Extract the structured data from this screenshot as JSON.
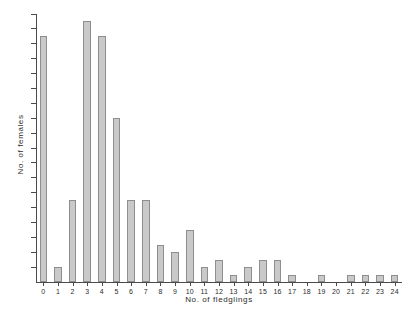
{
  "chart_data": {
    "type": "bar",
    "title": "",
    "xlabel": "No. of fledglings",
    "ylabel": "No. of females",
    "categories": [
      "0",
      "1",
      "2",
      "3",
      "4",
      "5",
      "6",
      "7",
      "8",
      "9",
      "10",
      "11",
      "12",
      "13",
      "14",
      "15",
      "16",
      "17",
      "18",
      "19",
      "20",
      "21",
      "22",
      "23",
      "24"
    ],
    "values": [
      33,
      2,
      11,
      35,
      33,
      22,
      11,
      11,
      5,
      4,
      7,
      2,
      3,
      1,
      2,
      3,
      3,
      1,
      0,
      1,
      0,
      1,
      1,
      1,
      1
    ],
    "series": [
      {
        "name": "No. of females",
        "values": [
          33,
          2,
          11,
          35,
          33,
          22,
          11,
          11,
          5,
          4,
          7,
          2,
          3,
          1,
          2,
          3,
          3,
          1,
          0,
          1,
          0,
          1,
          1,
          1,
          1
        ]
      }
    ],
    "xlim": [
      -0.5,
      24.5
    ],
    "ylim": [
      0,
      36
    ],
    "y_ticks": [
      2,
      4,
      6,
      8,
      10,
      12,
      14,
      16,
      18,
      20,
      22,
      24,
      26,
      28,
      30,
      32,
      34,
      36
    ],
    "y_tick_labels": [
      "2",
      "4",
      "6",
      "8",
      "10",
      "12",
      "14",
      "16",
      "18",
      "20",
      "22",
      "24",
      "26",
      "28",
      "30",
      "32",
      "34",
      "36"
    ],
    "x_ticks": [
      0,
      1,
      2,
      3,
      4,
      5,
      6,
      7,
      8,
      9,
      10,
      11,
      12,
      13,
      14,
      15,
      16,
      17,
      18,
      19,
      20,
      21,
      22,
      23,
      24
    ],
    "x_tick_labels": [
      "0",
      "1",
      "2",
      "3",
      "4",
      "5",
      "6",
      "7",
      "8",
      "9",
      "10",
      "11",
      "12",
      "13",
      "14",
      "15",
      "16",
      "17",
      "18",
      "19",
      "20",
      "21",
      "22",
      "23",
      "24"
    ],
    "grid": false,
    "legend": null,
    "legend_position": "none",
    "bar_color": "#c9c9c9",
    "bar_edge_color": "#8e8e8e",
    "axis_color": "#4a4a4a",
    "background_color": "#ffffff"
  }
}
